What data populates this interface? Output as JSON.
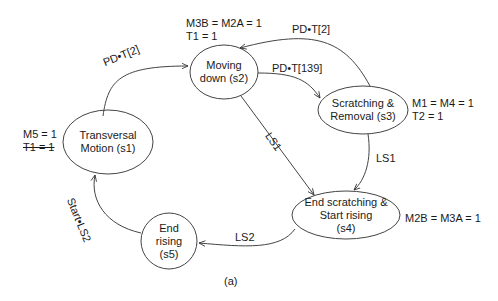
{
  "caption": "(a)",
  "nodes": [
    {
      "id": "s1",
      "line1": "Transversal",
      "line2": "Motion (s1)",
      "outputs": [
        "M5 = 1",
        "T1 = 1"
      ],
      "struck": [
        false,
        true
      ]
    },
    {
      "id": "s2",
      "line1": "Moving",
      "line2": "down (s2)",
      "outputs": [
        "M3B = M2A = 1",
        "T1 = 1"
      ]
    },
    {
      "id": "s3",
      "line1": "Scratching &",
      "line2": "Removal (s3)",
      "outputs": [
        "M1 = M4 = 1",
        "T2 = 1"
      ]
    },
    {
      "id": "s4",
      "line1": "End scratching &",
      "line2": "Start rising",
      "line3": "(s4)",
      "outputs": [
        "M2B = M3A = 1"
      ]
    },
    {
      "id": "s5",
      "line1": "End",
      "line2": "rising",
      "line3": "(s5)",
      "outputs": []
    }
  ],
  "transitions": [
    {
      "from": "s1",
      "to": "s2",
      "label": "PD•T[2]"
    },
    {
      "from": "s2",
      "to": "s3",
      "label": "PD•T[139]"
    },
    {
      "from": "s3",
      "to": "s2",
      "label": "PD•T[2]"
    },
    {
      "from": "s2",
      "to": "s4",
      "label": "LS1"
    },
    {
      "from": "s3",
      "to": "s4",
      "label": "LS1"
    },
    {
      "from": "s4",
      "to": "s5",
      "label": "LS2"
    },
    {
      "from": "s5",
      "to": "s1",
      "label": "Start•LS2"
    }
  ]
}
